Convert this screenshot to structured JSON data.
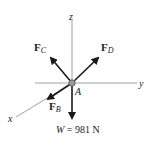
{
  "diagram": {
    "type": "free-body-diagram",
    "axes": {
      "z": "z",
      "y": "y",
      "x": "x"
    },
    "point_label": "A",
    "forces": {
      "FC": {
        "main": "F",
        "sub": "C"
      },
      "FD": {
        "main": "F",
        "sub": "D"
      },
      "FB": {
        "main": "F",
        "sub": "B"
      },
      "W": {
        "symbol": "W",
        "eq": " = 981 N"
      }
    },
    "colors": {
      "line": "#888888",
      "arrow": "#1a1a1a",
      "text": "#222222"
    }
  }
}
